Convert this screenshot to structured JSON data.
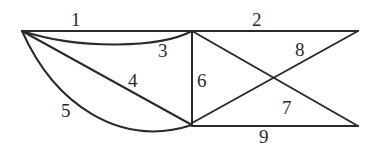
{
  "diagram": {
    "type": "graph",
    "vertices": [
      {
        "id": "A",
        "x": 22,
        "y": 31
      },
      {
        "id": "B",
        "x": 192,
        "y": 31
      },
      {
        "id": "C",
        "x": 358,
        "y": 31
      },
      {
        "id": "D",
        "x": 192,
        "y": 125
      },
      {
        "id": "E",
        "x": 358,
        "y": 126
      }
    ],
    "edges": [
      {
        "label": "1",
        "from": "A",
        "to": "B",
        "shape": "line"
      },
      {
        "label": "2",
        "from": "B",
        "to": "C",
        "shape": "line"
      },
      {
        "label": "3",
        "from": "A",
        "to": "B",
        "shape": "curve"
      },
      {
        "label": "4",
        "from": "A",
        "to": "D",
        "shape": "line"
      },
      {
        "label": "5",
        "from": "A",
        "to": "D",
        "shape": "curve"
      },
      {
        "label": "6",
        "from": "B",
        "to": "D",
        "shape": "line"
      },
      {
        "label": "7",
        "from": "B",
        "to": "E",
        "shape": "line"
      },
      {
        "label": "8",
        "from": "D",
        "to": "C",
        "shape": "line"
      },
      {
        "label": "9",
        "from": "D",
        "to": "E",
        "shape": "line"
      }
    ]
  }
}
